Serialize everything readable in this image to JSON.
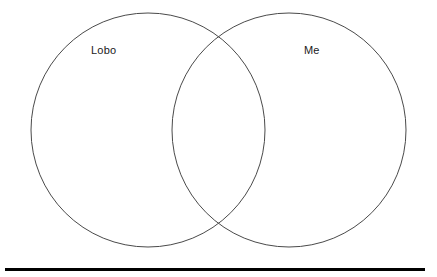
{
  "diagram": {
    "type": "venn-two-set",
    "title": "",
    "background_color": "#ffffff",
    "outline_color": "#4a4a4a",
    "outline_width": 1,
    "left_circle": {
      "label": "Lobo",
      "center_x": 148,
      "center_y": 130,
      "radius": 117,
      "fill": "none"
    },
    "right_circle": {
      "label": "Me",
      "center_x": 289,
      "center_y": 130,
      "radius": 117,
      "fill": "none"
    },
    "overlap_region": {
      "label": "",
      "contents": []
    },
    "left_only_region": {
      "contents": []
    },
    "right_only_region": {
      "contents": []
    }
  },
  "rule": {
    "color": "#000000",
    "thickness": 3,
    "left": 5,
    "width": 420
  }
}
